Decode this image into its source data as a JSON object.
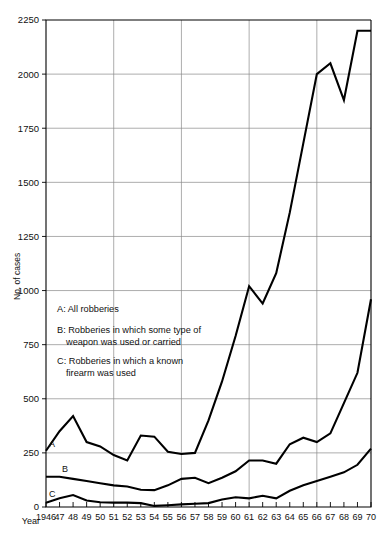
{
  "chart_data": {
    "type": "line",
    "title": "",
    "xlabel": "Year",
    "ylabel": "No. of cases",
    "xlim": [
      1946,
      1970
    ],
    "ylim": [
      0,
      2250
    ],
    "ytick_step": 250,
    "grid": true,
    "grid_y_values": [
      0,
      250,
      500,
      750,
      1000,
      1250,
      1500,
      1750,
      2000,
      2250
    ],
    "grid_x_values": [
      1946,
      1951,
      1956,
      1961,
      1966
    ],
    "legend_position": "inside-left",
    "x": [
      1946,
      1947,
      1948,
      1949,
      1950,
      1951,
      1952,
      1953,
      1954,
      1955,
      1956,
      1957,
      1958,
      1959,
      1960,
      1961,
      1962,
      1963,
      1964,
      1965,
      1966,
      1967,
      1968,
      1969,
      1970
    ],
    "xtick_labels": [
      "1946",
      "47",
      "48",
      "49",
      "50",
      "51",
      "52",
      "53",
      "54",
      "55",
      "56",
      "57",
      "58",
      "59",
      "60",
      "61",
      "62",
      "63",
      "64",
      "65",
      "66",
      "67",
      "68",
      "69",
      "70"
    ],
    "ytick_labels": [
      "0",
      "250",
      "500",
      "750",
      "1000",
      "1250",
      "1500",
      "1750",
      "2000",
      "2250"
    ],
    "series": [
      {
        "name": "A",
        "label": "All robberies",
        "legend_key": "A: All robberies",
        "inline_label": "A",
        "color": "#000000",
        "values": [
          260,
          350,
          420,
          300,
          280,
          240,
          215,
          330,
          325,
          255,
          245,
          250,
          400,
          580,
          790,
          1020,
          940,
          1080,
          1360,
          1680,
          2000,
          2050,
          1880,
          2200,
          2200
        ]
      },
      {
        "name": "B",
        "label": "Robberies in which some type of weapon was used or carried",
        "legend_key": "B: Robberies in which some type of weapon was used or carried",
        "inline_label": "B",
        "color": "#000000",
        "values": [
          140,
          140,
          130,
          120,
          110,
          100,
          95,
          80,
          78,
          100,
          130,
          135,
          110,
          135,
          165,
          215,
          215,
          200,
          290,
          320,
          300,
          340,
          480,
          620,
          960
        ]
      },
      {
        "name": "C",
        "label": "Robberies in which a known firearm was used",
        "legend_key": "C: Robberies in which a known firearm was used",
        "inline_label": "C",
        "color": "#000000",
        "values": [
          20,
          40,
          55,
          30,
          22,
          20,
          20,
          18,
          5,
          8,
          12,
          15,
          18,
          35,
          45,
          40,
          52,
          40,
          75,
          100,
          120,
          140,
          160,
          195,
          270
        ]
      }
    ],
    "legend_entries": [
      {
        "key": "A",
        "line1": "A: All robberies",
        "line2": ""
      },
      {
        "key": "B",
        "line1": "B: Robberies in which some type of",
        "line2": "weapon was used or carried"
      },
      {
        "key": "C",
        "line1": "C: Robberies in which a known",
        "line2": "firearm was used"
      }
    ]
  }
}
